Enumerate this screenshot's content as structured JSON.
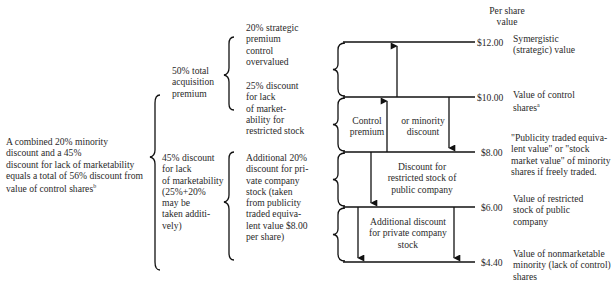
{
  "header": {
    "per_share_label": "Per share\nvalue"
  },
  "left": {
    "combined_text": "A combined 20% minority\ndiscount and a 45%\ndiscount for lack of marketability\nequals a total of 56% discount from\nvalue of control shares",
    "combined_footnote": "b"
  },
  "middle": {
    "acquisition_premium": "50% total\nacquisition\npremium",
    "marketability_discount": "45% discount\nfor lack\nof marketability\n(25%+20%\nmay be\ntaken additi-\nvely)"
  },
  "breakdown": {
    "strategic_premium": "20% strategic\npremium\ncontrol\novervalued",
    "restricted_discount": "25% discount\nfor lack\nof market-\nability for\nrestricted stock",
    "private_discount": "Additional 20%\ndiscount for pri-\nvate company\nstock (taken\nfrom publicity\ntraded equiva-\nlent value $8.00\nper share)"
  },
  "bands": {
    "control_premium": "Control\npremium",
    "minority_discount": "or minority\ndiscount",
    "restricted_public": "Discount for\nrestricted stock of\npublic company",
    "private_company": "Additional discount\nfor private company\nstock"
  },
  "levels": [
    {
      "value": "$12.00",
      "label": "Symergistic\n(strategic) value",
      "footnote": ""
    },
    {
      "value": "$10.00",
      "label": "Value of control\nshares",
      "footnote": "a"
    },
    {
      "value": "$8.00",
      "label": "\"Publicity traded equiva-\nlent value\" or \"stock\nmarket value\" of minority\nshares if freely traded.",
      "footnote": ""
    },
    {
      "value": "$6.00",
      "label": "Value of restricted\nstock of public\ncompany",
      "footnote": ""
    },
    {
      "value": "$4.40",
      "label": "Value of nonmarketable\nminority (lack of control)\nshares",
      "footnote": ""
    }
  ]
}
